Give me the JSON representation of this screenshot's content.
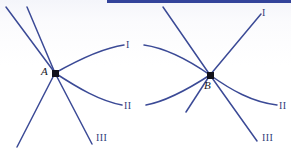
{
  "figure": {
    "kind": "line-diagram",
    "width": 291,
    "height": 154,
    "background_color": "#fdfdfe",
    "curve_color": "#3b4a96",
    "node_color": "#12121c",
    "label_color": "#2e3d7a",
    "top_rule": {
      "color": "#33439a",
      "x": 107,
      "y": 0,
      "width": 184,
      "height": 3
    }
  },
  "nodes": [
    {
      "id": "A",
      "label": "A",
      "x": 55,
      "y": 73,
      "label_x": 41,
      "label_y": 66
    },
    {
      "id": "B",
      "label": "B",
      "x": 210,
      "y": 75,
      "label_x": 204,
      "label_y": 80
    }
  ],
  "branch_labels": [
    {
      "id": "left-I",
      "text": "I",
      "x": 126,
      "y": 40
    },
    {
      "id": "left-II",
      "text": "II",
      "x": 124,
      "y": 101
    },
    {
      "id": "left-III",
      "text": "III",
      "x": 96,
      "y": 133
    },
    {
      "id": "right-I",
      "text": "I",
      "x": 262,
      "y": 8
    },
    {
      "id": "right-II",
      "text": "II",
      "x": 279,
      "y": 101
    },
    {
      "id": "right-III",
      "text": "III",
      "x": 262,
      "y": 133
    }
  ],
  "paths": [
    {
      "id": "A-up-left-outer",
      "d": "M 6 7 L 55 73",
      "width": 1.5
    },
    {
      "id": "A-up-left-inner",
      "d": "M 27 7 L 55 73",
      "width": 1.5
    },
    {
      "id": "A-down-left",
      "d": "M 55 73 L 17 147",
      "width": 1.5
    },
    {
      "id": "A-down-right",
      "d": "M 55 73 L 92 144",
      "width": 1.5
    },
    {
      "id": "A-arc-upper-I",
      "d": "M 55 73 C 78 60 103 48 124 45",
      "width": 1.5
    },
    {
      "id": "A-arc-lower-II",
      "d": "M 55 73 C 78 88 100 101 122 105",
      "width": 1.5
    },
    {
      "id": "B-arc-upper-left",
      "d": "M 144 45 C 165 48 190 61 210 75",
      "width": 1.5
    },
    {
      "id": "B-arc-lower-left",
      "d": "M 146 105 C 168 101 190 88 210 75",
      "width": 1.5
    },
    {
      "id": "B-up-left-outer",
      "d": "M 163 7 L 210 75",
      "width": 1.5
    },
    {
      "id": "B-up-right-I",
      "d": "M 210 75 L 261 14",
      "width": 1.5
    },
    {
      "id": "B-down-left",
      "d": "M 210 75 L 186 112",
      "width": 1.5
    },
    {
      "id": "B-down-right-III",
      "d": "M 210 75 L 257 141",
      "width": 1.5
    },
    {
      "id": "B-arc-right-II",
      "d": "M 210 75 C 231 90 252 102 277 105",
      "width": 1.5
    }
  ]
}
